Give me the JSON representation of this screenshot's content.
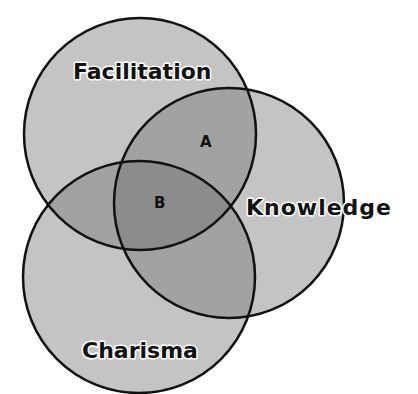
{
  "diagram": {
    "type": "venn",
    "colors": {
      "circle_fill": "#c4c4c4",
      "two_overlap_fill": "#a2a2a2",
      "three_overlap_fill": "#8c8c8c",
      "stroke": "#111111",
      "background": "#ffffff"
    },
    "circles": [
      {
        "id": "facilitation",
        "label": "Facilitation",
        "cx": 140,
        "cy": 134,
        "r": 116
      },
      {
        "id": "knowledge",
        "label": "Knowledge",
        "cx": 229,
        "cy": 203,
        "r": 115
      },
      {
        "id": "charisma",
        "label": "Charisma",
        "cx": 139,
        "cy": 277,
        "r": 116
      }
    ],
    "region_labels": [
      {
        "id": "A",
        "label": "A",
        "description": "Facilitation ∩ Knowledge"
      },
      {
        "id": "B",
        "label": "B",
        "description": "Facilitation ∩ Knowledge ∩ Charisma"
      }
    ]
  }
}
